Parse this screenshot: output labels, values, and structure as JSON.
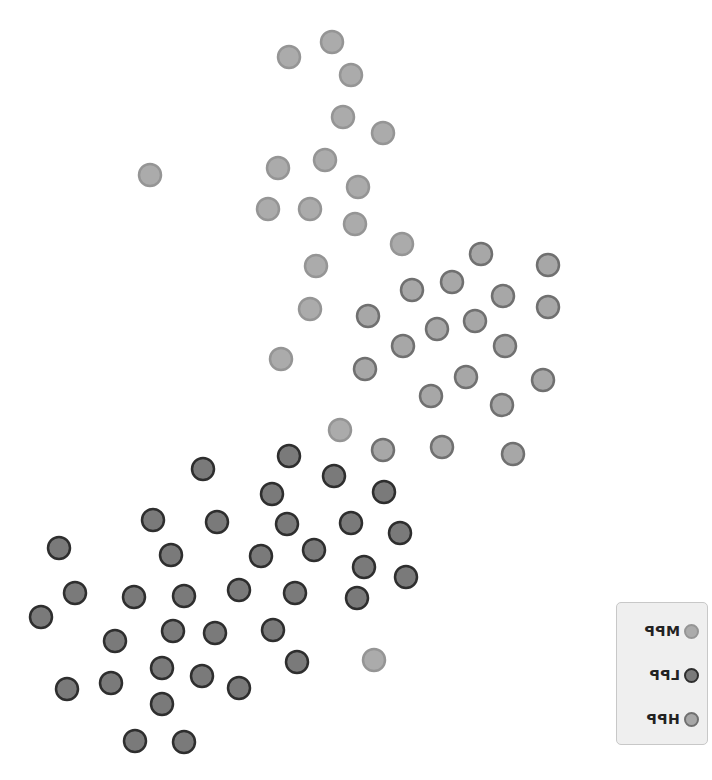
{
  "chart_data": {
    "type": "scatter",
    "title": "",
    "xlabel": "",
    "ylabel": "",
    "grid": false,
    "axes_visible": false,
    "legend_position": "bottom-right",
    "legend_text_mirrored": true,
    "series": [
      {
        "name": "MPP",
        "fill": "#ababab",
        "stroke": "#959595",
        "points": [
          [
            289,
            57
          ],
          [
            332,
            42
          ],
          [
            351,
            75
          ],
          [
            343,
            117
          ],
          [
            383,
            133
          ],
          [
            150,
            175
          ],
          [
            278,
            168
          ],
          [
            325,
            160
          ],
          [
            358,
            187
          ],
          [
            268,
            209
          ],
          [
            310,
            209
          ],
          [
            355,
            224
          ],
          [
            402,
            244
          ],
          [
            316,
            266
          ],
          [
            310,
            309
          ],
          [
            281,
            359
          ],
          [
            340,
            430
          ],
          [
            374,
            660
          ]
        ]
      },
      {
        "name": "LPP",
        "fill": "#7a7a7a",
        "stroke": "#2e2e2e",
        "points": [
          [
            203,
            469
          ],
          [
            289,
            456
          ],
          [
            334,
            476
          ],
          [
            272,
            494
          ],
          [
            384,
            492
          ],
          [
            217,
            522
          ],
          [
            287,
            524
          ],
          [
            351,
            523
          ],
          [
            400,
            533
          ],
          [
            153,
            520
          ],
          [
            314,
            550
          ],
          [
            261,
            556
          ],
          [
            171,
            555
          ],
          [
            59,
            548
          ],
          [
            75,
            593
          ],
          [
            134,
            597
          ],
          [
            184,
            596
          ],
          [
            239,
            590
          ],
          [
            295,
            593
          ],
          [
            357,
            598
          ],
          [
            364,
            567
          ],
          [
            406,
            577
          ],
          [
            41,
            617
          ],
          [
            115,
            641
          ],
          [
            173,
            631
          ],
          [
            215,
            633
          ],
          [
            273,
            630
          ],
          [
            297,
            662
          ],
          [
            67,
            689
          ],
          [
            111,
            683
          ],
          [
            162,
            668
          ],
          [
            202,
            676
          ],
          [
            239,
            688
          ],
          [
            162,
            704
          ],
          [
            135,
            741
          ],
          [
            184,
            742
          ]
        ]
      },
      {
        "name": "HPP",
        "fill": "#a7a7a7",
        "stroke": "#707070",
        "points": [
          [
            481,
            254
          ],
          [
            548,
            265
          ],
          [
            452,
            282
          ],
          [
            412,
            290
          ],
          [
            503,
            296
          ],
          [
            548,
            307
          ],
          [
            368,
            316
          ],
          [
            475,
            321
          ],
          [
            437,
            329
          ],
          [
            403,
            346
          ],
          [
            505,
            346
          ],
          [
            365,
            369
          ],
          [
            466,
            377
          ],
          [
            431,
            396
          ],
          [
            543,
            380
          ],
          [
            502,
            405
          ],
          [
            442,
            447
          ],
          [
            513,
            454
          ],
          [
            383,
            450
          ]
        ]
      }
    ],
    "marker_radius": 11
  },
  "legend": {
    "items": [
      {
        "label": "MPP",
        "fill": "#ababab",
        "stroke": "#959595"
      },
      {
        "label": "LPP",
        "fill": "#7a7a7a",
        "stroke": "#2e2e2e"
      },
      {
        "label": "HPP",
        "fill": "#a7a7a7",
        "stroke": "#707070"
      }
    ]
  }
}
